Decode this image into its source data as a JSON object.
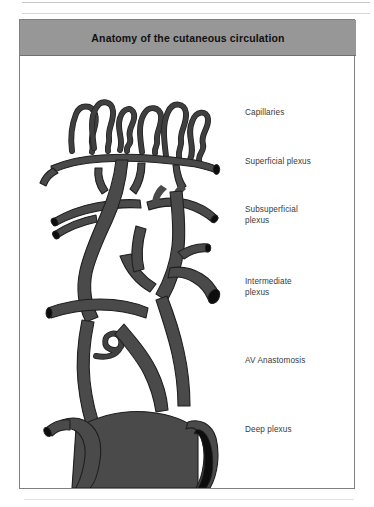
{
  "figure": {
    "title": "Anatomy of the cutaneous circulation",
    "title_bar_color": "#979797",
    "border_color": "#808080",
    "background_color": "#ffffff"
  },
  "illustration": {
    "name": "cutaneous-circulation-diagram",
    "vessel_color": "#4a4a4a",
    "vessel_outline_color": "#1c1c1c",
    "lumen_color": "#0d0d0d",
    "description": "Three-dimensional drawing of the blood vessel network of the skin showing hairpin capillary loops at the top feeding down through successive horizontal vascular plexuses to large deep vessels at the bottom"
  },
  "labels": [
    {
      "id": "capillaries",
      "text": "Capillaries"
    },
    {
      "id": "superficial",
      "text": "Superficial plexus"
    },
    {
      "id": "subsuperficial",
      "text": "Subsuperficial\nplexus"
    },
    {
      "id": "intermediate",
      "text": "Intermediate\nplexus"
    },
    {
      "id": "av",
      "text": "AV Anastomosis"
    },
    {
      "id": "deep",
      "text": "Deep plexus"
    }
  ]
}
